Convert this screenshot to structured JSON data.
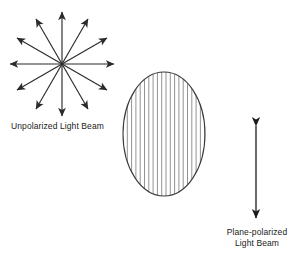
{
  "figure": {
    "background_color": "#ffffff",
    "stroke_color": "#2b2b2b",
    "text_color": "#1a1a1a",
    "width": 300,
    "height": 259
  },
  "unpolarized": {
    "label": "Unpolarized Light Beam",
    "center_x": 62,
    "center_y": 64,
    "ray_length": 52,
    "ray_count": 12,
    "ray_angles_deg": [
      0,
      30,
      60,
      90,
      120,
      150,
      180,
      210,
      240,
      270,
      300,
      330
    ],
    "arrowhead": "filled-triangle"
  },
  "polarizer": {
    "name": "hatched-ellipse",
    "center_x": 164,
    "center_y": 134,
    "radius_x": 41,
    "radius_y": 62,
    "hatch_orientation": "vertical",
    "hatch_count": 19,
    "hatch_spacing": 4.3
  },
  "polarized": {
    "label_line1": "Plane-polarized",
    "label_line2": "Light Beam",
    "arrow_x": 256,
    "arrow_top_y": 126,
    "arrow_bottom_y": 218,
    "arrowhead": "double-headed-vertical"
  }
}
